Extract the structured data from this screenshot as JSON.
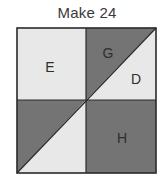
{
  "title": "Make 24",
  "colors": {
    "light": "#e8e8e8",
    "dark": "#747474",
    "stroke": "#2a2a2a",
    "text": "#2e2e2e"
  },
  "square": {
    "x": 17,
    "y": 28,
    "width": 139,
    "height": 145
  },
  "regions": [
    {
      "label": "E",
      "shade": "light",
      "quadrant": "top-left"
    },
    {
      "label": "G",
      "shade": "dark",
      "quadrant": "top-right-upper-triangle"
    },
    {
      "label": "D",
      "shade": "light",
      "quadrant": "top-right-lower-triangle"
    },
    {
      "label": "",
      "shade": "dark",
      "quadrant": "bottom-left-upper-triangle"
    },
    {
      "label": "",
      "shade": "light",
      "quadrant": "bottom-left-lower-triangle"
    },
    {
      "label": "H",
      "shade": "dark",
      "quadrant": "bottom-right"
    }
  ],
  "labels": {
    "e": "E",
    "g": "G",
    "d": "D",
    "h": "H"
  }
}
